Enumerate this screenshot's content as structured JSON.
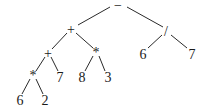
{
  "diagram": {
    "type": "expression-tree",
    "nodes": [
      {
        "id": "n0",
        "label": "−",
        "x": 118,
        "y": 5
      },
      {
        "id": "n1",
        "label": "+",
        "x": 71,
        "y": 29
      },
      {
        "id": "n2",
        "label": "/",
        "x": 166,
        "y": 31
      },
      {
        "id": "n3",
        "label": "+",
        "x": 48,
        "y": 53
      },
      {
        "id": "n4",
        "label": "*",
        "x": 96,
        "y": 52
      },
      {
        "id": "n5",
        "label": "6",
        "x": 143,
        "y": 54
      },
      {
        "id": "n6",
        "label": "7",
        "x": 192,
        "y": 54
      },
      {
        "id": "n7",
        "label": "*",
        "x": 33,
        "y": 75
      },
      {
        "id": "n8",
        "label": "7",
        "x": 60,
        "y": 77
      },
      {
        "id": "n9",
        "label": "8",
        "x": 82,
        "y": 77
      },
      {
        "id": "n10",
        "label": "3",
        "x": 108,
        "y": 77
      },
      {
        "id": "n11",
        "label": "6",
        "x": 20,
        "y": 100
      },
      {
        "id": "n12",
        "label": "2",
        "x": 45,
        "y": 100
      }
    ],
    "edges": [
      {
        "from": "n0",
        "to": "n1",
        "x1": 110,
        "y1": 7,
        "x2": 78,
        "y2": 25
      },
      {
        "from": "n0",
        "to": "n2",
        "x1": 127,
        "y1": 7,
        "x2": 163,
        "y2": 27
      },
      {
        "from": "n1",
        "to": "n3",
        "x1": 67,
        "y1": 33,
        "x2": 52,
        "y2": 49
      },
      {
        "from": "n1",
        "to": "n4",
        "x1": 76,
        "y1": 33,
        "x2": 93,
        "y2": 48
      },
      {
        "from": "n2",
        "to": "n5",
        "x1": 162,
        "y1": 35,
        "x2": 148,
        "y2": 48
      },
      {
        "from": "n2",
        "to": "n6",
        "x1": 171,
        "y1": 35,
        "x2": 187,
        "y2": 48
      },
      {
        "from": "n3",
        "to": "n7",
        "x1": 45,
        "y1": 57,
        "x2": 36,
        "y2": 71
      },
      {
        "from": "n3",
        "to": "n8",
        "x1": 51,
        "y1": 57,
        "x2": 58,
        "y2": 71
      },
      {
        "from": "n4",
        "to": "n9",
        "x1": 93,
        "y1": 56,
        "x2": 85,
        "y2": 71
      },
      {
        "from": "n4",
        "to": "n10",
        "x1": 99,
        "y1": 56,
        "x2": 105,
        "y2": 71
      },
      {
        "from": "n7",
        "to": "n11",
        "x1": 30,
        "y1": 79,
        "x2": 22,
        "y2": 94
      },
      {
        "from": "n7",
        "to": "n12",
        "x1": 36,
        "y1": 79,
        "x2": 43,
        "y2": 94
      }
    ],
    "expression": "((6 * 2) + 7) + (8 * 3) − (6 / 7)"
  }
}
